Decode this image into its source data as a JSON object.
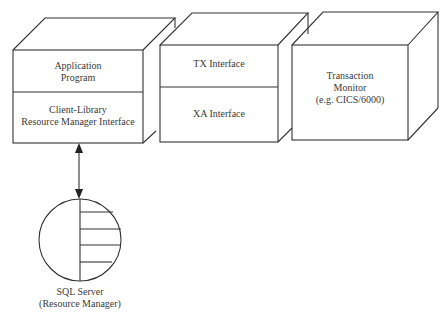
{
  "diagram": {
    "boxes": [
      {
        "id": "client",
        "sections": [
          {
            "lines": [
              "Application",
              "Program"
            ]
          },
          {
            "lines": [
              "Client-Library",
              "Resource Manager Interface"
            ]
          }
        ]
      },
      {
        "id": "interfaces",
        "sections": [
          {
            "lines": [
              "TX Interface"
            ]
          },
          {
            "lines": [
              "XA Interface"
            ]
          }
        ]
      },
      {
        "id": "tm",
        "sections": [
          {
            "lines": [
              "Transaction",
              "Monitor",
              "(e.g. CICS/6000)"
            ]
          }
        ]
      }
    ],
    "database": {
      "lines": [
        "SQL Server",
        "(Resource Manager)"
      ]
    },
    "connector": "bidirectional-arrow",
    "caption": "Figure ... X/Open DTP model (partially cropped)"
  },
  "colors": {
    "stroke": "#333333",
    "background": "#ffffff",
    "text": "#3a3a3a"
  }
}
